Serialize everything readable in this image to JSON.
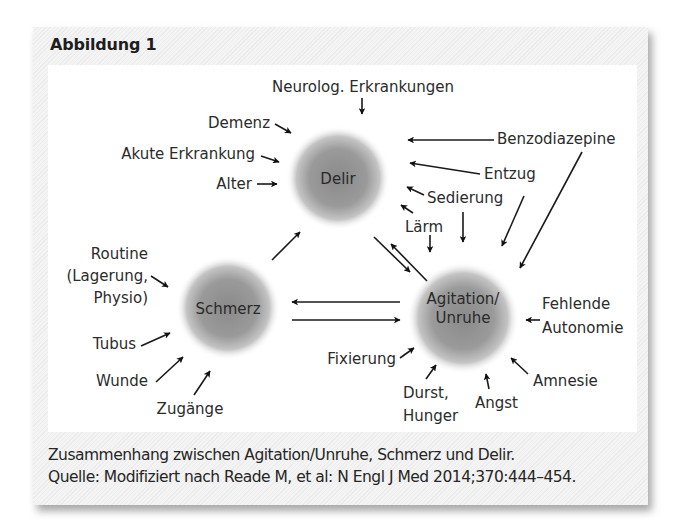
{
  "figure": {
    "title": "Abbildung 1",
    "caption_line1": "Zusammenhang zwischen Agitation/Unruhe, Schmerz und Delir.",
    "caption_line2": "Quelle: Modifiziert nach Reade M, et al: N Engl J Med 2014;370:444–454."
  },
  "nodes": {
    "delir": "Delir",
    "schmerz": "Schmerz",
    "agitation_line1": "Agitation/",
    "agitation_line2": "Unruhe"
  },
  "factors": {
    "neurolog": "Neurolog. Erkrankungen",
    "demenz": "Demenz",
    "akute": "Akute Erkrankung",
    "alter": "Alter",
    "benzo": "Benzodiazepine",
    "entzug": "Entzug",
    "sedierung": "Sedierung",
    "laerm": "Lärm",
    "routine_line1": "Routine",
    "routine_line2": "(Lagerung,",
    "routine_line3": "Physio)",
    "tubus": "Tubus",
    "wunde": "Wunde",
    "zugaenge": "Zugänge",
    "fehlende_line1": "Fehlende",
    "fehlende_line2": "Autonomie",
    "fixierung": "Fixierung",
    "durst_line1": "Durst,",
    "durst_line2": "Hunger",
    "angst": "Angst",
    "amnesie": "Amnesie"
  },
  "relations": [
    {
      "from": "Schmerz",
      "to": "Delir"
    },
    {
      "from": "Delir",
      "to": "Agitation/Unruhe"
    },
    {
      "from": "Agitation/Unruhe",
      "to": "Delir"
    },
    {
      "from": "Agitation/Unruhe",
      "to": "Schmerz"
    },
    {
      "from": "Schmerz",
      "to": "Agitation/Unruhe"
    },
    {
      "from": "Neurolog. Erkrankungen",
      "to": "Delir"
    },
    {
      "from": "Demenz",
      "to": "Delir"
    },
    {
      "from": "Akute Erkrankung",
      "to": "Delir"
    },
    {
      "from": "Alter",
      "to": "Delir"
    },
    {
      "from": "Benzodiazepine",
      "to": "Delir"
    },
    {
      "from": "Benzodiazepine",
      "to": "Agitation/Unruhe"
    },
    {
      "from": "Entzug",
      "to": "Delir"
    },
    {
      "from": "Entzug",
      "to": "Agitation/Unruhe"
    },
    {
      "from": "Sedierung",
      "to": "Delir"
    },
    {
      "from": "Sedierung",
      "to": "Agitation/Unruhe"
    },
    {
      "from": "Lärm",
      "to": "Delir"
    },
    {
      "from": "Lärm",
      "to": "Agitation/Unruhe"
    },
    {
      "from": "Routine (Lagerung, Physio)",
      "to": "Schmerz"
    },
    {
      "from": "Tubus",
      "to": "Schmerz"
    },
    {
      "from": "Wunde",
      "to": "Schmerz"
    },
    {
      "from": "Zugänge",
      "to": "Schmerz"
    },
    {
      "from": "Fehlende Autonomie",
      "to": "Agitation/Unruhe"
    },
    {
      "from": "Fixierung",
      "to": "Agitation/Unruhe"
    },
    {
      "from": "Durst, Hunger",
      "to": "Agitation/Unruhe"
    },
    {
      "from": "Angst",
      "to": "Agitation/Unruhe"
    },
    {
      "from": "Amnesie",
      "to": "Agitation/Unruhe"
    }
  ]
}
